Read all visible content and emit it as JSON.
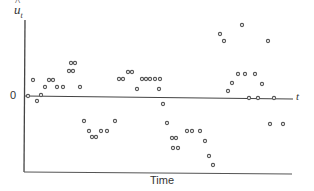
{
  "chart_data": {
    "type": "scatter",
    "title": "",
    "xlabel": "Time",
    "ylabel": "û_t",
    "y_axis_symbol": "u",
    "y_axis_subscript": "t",
    "x_axis_end_label": "t",
    "zero_label": "0",
    "grid": false,
    "legend": null,
    "x_unit_note": "time index (approximate, read from pixel position)",
    "ylim": [
      -9,
      9
    ],
    "xlim": [
      0,
      56
    ],
    "points": [
      {
        "t": 1,
        "v": 0.1
      },
      {
        "t": 2,
        "v": 2.0
      },
      {
        "t": 3,
        "v": -0.6
      },
      {
        "t": 4,
        "v": 0.1
      },
      {
        "t": 5,
        "v": 1.1
      },
      {
        "t": 6,
        "v": 2.0
      },
      {
        "t": 7,
        "v": 2.0
      },
      {
        "t": 8,
        "v": 1.1
      },
      {
        "t": 9,
        "v": 1.1
      },
      {
        "t": 10,
        "v": 3.0
      },
      {
        "t": 11,
        "v": 3.0
      },
      {
        "t": 12,
        "v": 4.0
      },
      {
        "t": 13,
        "v": 4.0
      },
      {
        "t": 14,
        "v": 1.1
      },
      {
        "t": 15,
        "v": -3.1
      },
      {
        "t": 16,
        "v": -4.4
      },
      {
        "t": 17,
        "v": -5.1
      },
      {
        "t": 18,
        "v": -5.1
      },
      {
        "t": 19,
        "v": -4.4
      },
      {
        "t": 20,
        "v": -4.4
      },
      {
        "t": 21,
        "v": -3.1
      },
      {
        "t": 22,
        "v": 2.1
      },
      {
        "t": 23,
        "v": 2.1
      },
      {
        "t": 24,
        "v": 3.0
      },
      {
        "t": 25,
        "v": 3.0
      },
      {
        "t": 26,
        "v": 0.9
      },
      {
        "t": 27,
        "v": 2.1
      },
      {
        "t": 28,
        "v": 2.1
      },
      {
        "t": 29,
        "v": 2.1
      },
      {
        "t": 30,
        "v": 2.1
      },
      {
        "t": 31,
        "v": 0.9
      },
      {
        "t": 32,
        "v": 2.1
      },
      {
        "t": 33,
        "v": -1.0
      },
      {
        "t": 34,
        "v": -3.4
      },
      {
        "t": 35,
        "v": -5.3
      },
      {
        "t": 36,
        "v": -6.5
      },
      {
        "t": 37,
        "v": -5.3
      },
      {
        "t": 38,
        "v": -6.5
      },
      {
        "t": 39,
        "v": -4.4
      },
      {
        "t": 40,
        "v": -4.4
      },
      {
        "t": 41,
        "v": -4.4
      },
      {
        "t": 42,
        "v": -5.6
      },
      {
        "t": 43,
        "v": -7.5
      },
      {
        "t": 44,
        "v": -8.6
      },
      {
        "t": 45,
        "v": 7.8
      },
      {
        "t": 46,
        "v": 6.9
      },
      {
        "t": 47,
        "v": 0.6
      },
      {
        "t": 48,
        "v": 1.6
      },
      {
        "t": 49,
        "v": 2.6
      },
      {
        "t": 50,
        "v": 8.9
      },
      {
        "t": 51,
        "v": 2.6
      },
      {
        "t": 52,
        "v": -0.1
      },
      {
        "t": 53,
        "v": 2.6
      },
      {
        "t": 54,
        "v": -0.1
      },
      {
        "t": 55,
        "v": 1.5
      },
      {
        "t": 56,
        "v": 6.9
      },
      {
        "t": 57,
        "v": -0.1
      },
      {
        "t": 58,
        "v": -3.4
      },
      {
        "t": 59,
        "v": -3.4
      }
    ],
    "pixel_points": [
      [
        28,
        96
      ],
      [
        33,
        80
      ],
      [
        37,
        101
      ],
      [
        41,
        95
      ],
      [
        45,
        87
      ],
      [
        49,
        80
      ],
      [
        53,
        80
      ],
      [
        57,
        87
      ],
      [
        63,
        87
      ],
      [
        69,
        71
      ],
      [
        73,
        71
      ],
      [
        71,
        63
      ],
      [
        75,
        63
      ],
      [
        80,
        87
      ],
      [
        84,
        121
      ],
      [
        89,
        131
      ],
      [
        92,
        137
      ],
      [
        96,
        137
      ],
      [
        101,
        131
      ],
      [
        107,
        131
      ],
      [
        115,
        121
      ],
      [
        119,
        79
      ],
      [
        123,
        79
      ],
      [
        128,
        72
      ],
      [
        132,
        72
      ],
      [
        137,
        89
      ],
      [
        142,
        79
      ],
      [
        146,
        79
      ],
      [
        150,
        79
      ],
      [
        155,
        79
      ],
      [
        159,
        89
      ],
      [
        160,
        79
      ],
      [
        163,
        104
      ],
      [
        167,
        123
      ],
      [
        172,
        138
      ],
      [
        176,
        138
      ],
      [
        173,
        148
      ],
      [
        178,
        148
      ],
      [
        187,
        131
      ],
      [
        192,
        131
      ],
      [
        200,
        131
      ],
      [
        205,
        141
      ],
      [
        209,
        156
      ],
      [
        213,
        165
      ],
      [
        220,
        34
      ],
      [
        224,
        41
      ],
      [
        228,
        91
      ],
      [
        232,
        83
      ],
      [
        238,
        74
      ],
      [
        242,
        25
      ],
      [
        245,
        74
      ],
      [
        249,
        98
      ],
      [
        255,
        74
      ],
      [
        258,
        98
      ],
      [
        262,
        84
      ],
      [
        268,
        41
      ],
      [
        274,
        98
      ],
      [
        270,
        124
      ],
      [
        283,
        124
      ]
    ]
  },
  "colors": {
    "axis": "#444444",
    "marker": "#555555",
    "background": "#ffffff"
  }
}
